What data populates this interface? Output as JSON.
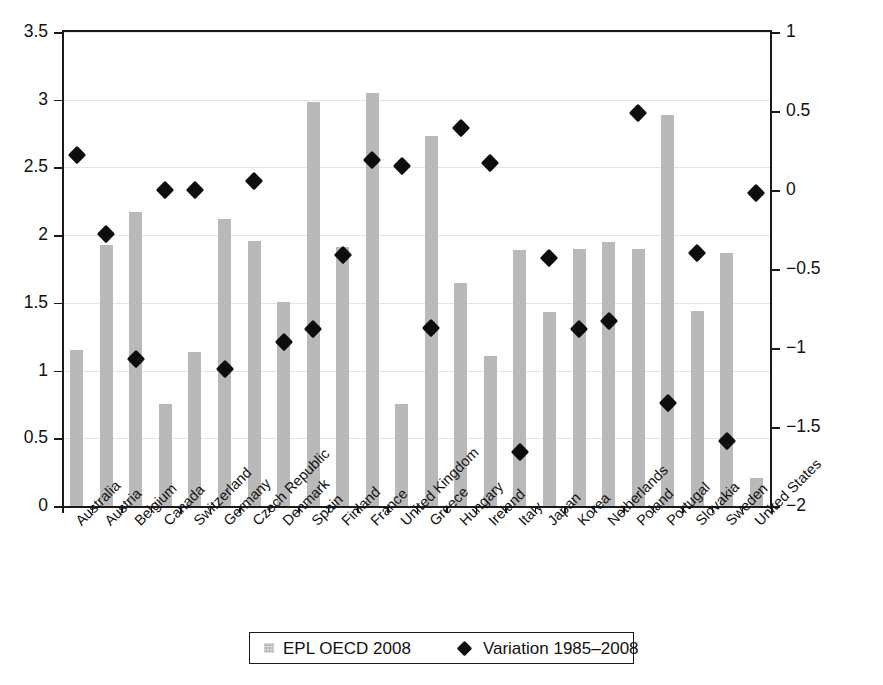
{
  "chart_data": {
    "type": "bar",
    "title": "",
    "subtitle": "",
    "xlabel": "",
    "ylabel": "",
    "ylabel_right": "",
    "grid": true,
    "legend_position": "bottom",
    "categories": [
      "Australia",
      "Austria",
      "Belgium",
      "Canada",
      "Switzerland",
      "Germany",
      "Czech Republic",
      "Denmark",
      "Spain",
      "Finland",
      "France",
      "United Kingdom",
      "Greece",
      "Hungary",
      "Ireland",
      "Italy",
      "Japan",
      "Korea",
      "Netherlands",
      "Poland",
      "Portugal",
      "Slovakia",
      "Sweden",
      "United States"
    ],
    "series": [
      {
        "name": "EPL OECD 2008",
        "type": "bar",
        "axis": "left",
        "color": "#b9b9b9",
        "values": [
          1.15,
          1.93,
          2.17,
          0.75,
          1.14,
          2.12,
          1.96,
          1.51,
          2.98,
          1.91,
          3.05,
          0.75,
          2.73,
          1.65,
          1.11,
          1.89,
          1.43,
          1.9,
          1.95,
          1.9,
          2.89,
          1.44,
          1.87,
          0.21
        ]
      },
      {
        "name": "Variation 1985–2008",
        "type": "scatter",
        "axis": "right",
        "marker": "diamond",
        "color": "#0d0d0d",
        "values": [
          0.22,
          -0.28,
          -1.07,
          0.0,
          0.0,
          -1.13,
          0.06,
          -0.96,
          -0.88,
          -0.41,
          0.19,
          0.15,
          -0.87,
          0.39,
          0.17,
          -1.66,
          -0.43,
          -0.88,
          -0.83,
          0.49,
          -1.35,
          -0.4,
          -1.59,
          -0.02
        ]
      }
    ],
    "axis_left": {
      "min": 0,
      "max": 3.5,
      "step": 0.5,
      "ticks": [
        "0",
        "0.5",
        "1",
        "1.5",
        "2",
        "2.5",
        "3",
        "3.5"
      ]
    },
    "axis_right": {
      "min": -2,
      "max": 1,
      "step": 0.5,
      "ticks": [
        "−2",
        "−1.5",
        "−1",
        "−0.5",
        "0",
        "0.5",
        "1"
      ]
    }
  },
  "legend": {
    "items": [
      {
        "label": "EPL OECD 2008",
        "marker": "square"
      },
      {
        "label": "Variation 1985–2008",
        "marker": "diamond"
      }
    ]
  },
  "colors": {
    "bar": "#b9b9b9",
    "marker": "#0d0d0d",
    "axis": "#1a1a1a",
    "grid": "#e4e4e4",
    "background": "#ffffff"
  }
}
